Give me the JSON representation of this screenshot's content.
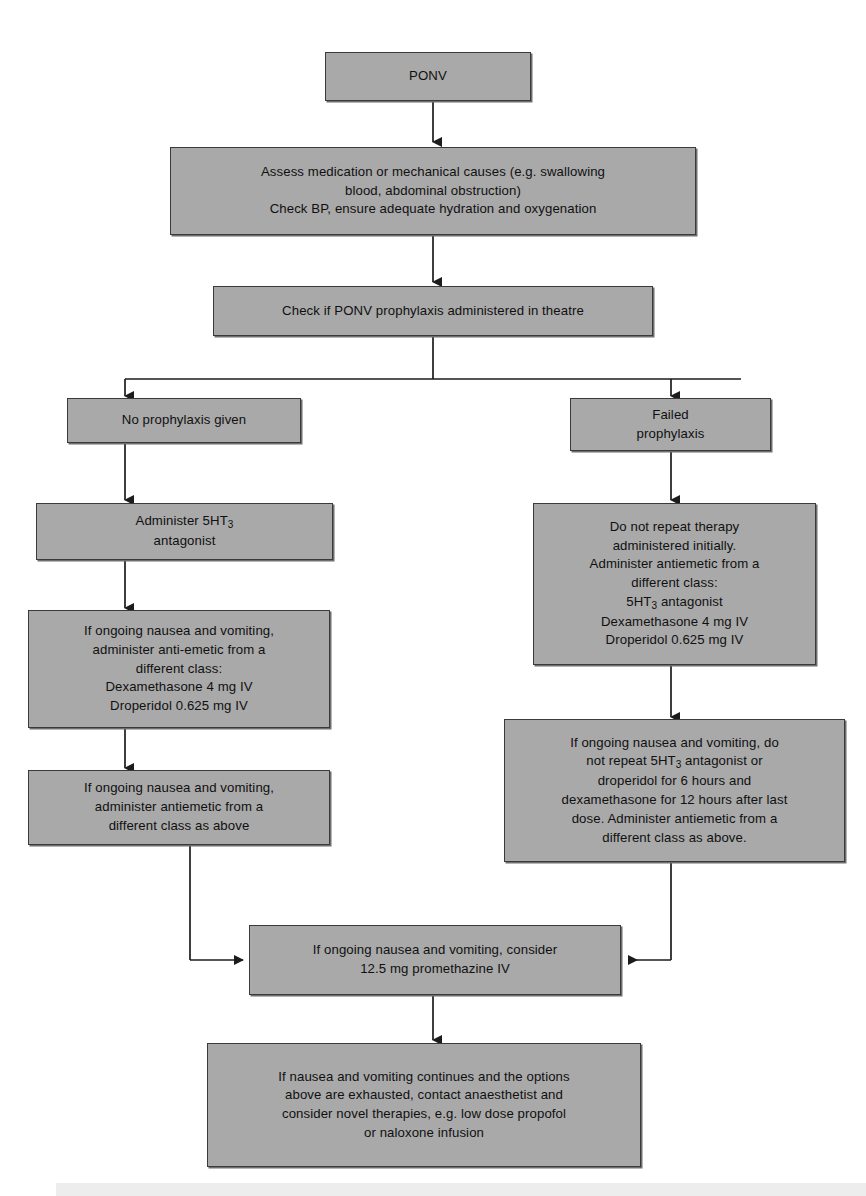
{
  "diagram": {
    "colors": {
      "node_fill": "#a9a9a9",
      "node_border": "#3a3a3a",
      "connector": "#1c1c1c",
      "page_background": "#ffffff",
      "bottom_band": "#ededed"
    },
    "nodes": [
      {
        "id": "ponv",
        "label": "PONV"
      },
      {
        "id": "assess-causes",
        "label": "Assess medication or mechanical causes (e.g. swallowing\nblood, abdominal obstruction)\nCheck BP, ensure adequate hydration and oxygenation"
      },
      {
        "id": "check-prophylaxis",
        "label": "Check if PONV prophylaxis administered in theatre"
      },
      {
        "id": "no-prophylaxis",
        "label": "No prophylaxis given"
      },
      {
        "id": "failed-prophylaxis",
        "label": "Failed\nprophylaxis"
      },
      {
        "id": "administer-5ht3",
        "label_pre": "Administer 5HT",
        "label_sub": "3",
        "label_post": "\nantagonist"
      },
      {
        "id": "left-second-line",
        "label": "If ongoing nausea and vomiting,\nadminister anti-emetic from a\ndifferent class:\nDexamethasone 4 mg IV\nDroperidol 0.625 mg IV"
      },
      {
        "id": "left-third-line",
        "label": "If ongoing nausea and vomiting,\nadminister antiemetic from a\ndifferent class as above"
      },
      {
        "id": "right-second-line",
        "label_pre": "Do not repeat therapy\nadministered initially.\nAdminister antiemetic from a\ndifferent class:\n5HT",
        "label_sub": "3",
        "label_post": " antagonist\nDexamethasone 4 mg IV\nDroperidol 0.625 mg IV"
      },
      {
        "id": "right-third-line",
        "label_pre": "If ongoing nausea and vomiting, do\nnot repeat 5HT",
        "label_sub": "3",
        "label_post": " antagonist or\ndroperidol for 6 hours and\ndexamethasone for 12 hours after last\ndose. Administer antiemetic from a\ndifferent class as above."
      },
      {
        "id": "promethazine",
        "label": "If ongoing nausea and vomiting, consider\n12.5 mg promethazine IV"
      },
      {
        "id": "novel-therapies",
        "label": "If nausea and vomiting continues and the options\nabove are exhausted, contact anaesthetist and\nconsider novel therapies, e.g. low dose propofol\nor naloxone infusion"
      }
    ]
  }
}
